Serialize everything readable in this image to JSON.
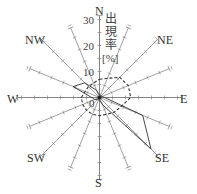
{
  "chart_data": {
    "type": "radar",
    "title": "",
    "axis_label": "出現率[%]",
    "axis_label_parts": [
      "出",
      "現",
      "率",
      "[%]"
    ],
    "radial_ticks": [
      0,
      10,
      20,
      30
    ],
    "radial_range": [
      0,
      30
    ],
    "directions": [
      "N",
      "NNE",
      "NE",
      "ENE",
      "E",
      "ESE",
      "SE",
      "SSE",
      "S",
      "SSW",
      "SW",
      "WSW",
      "W",
      "WNW",
      "NW",
      "NNW"
    ],
    "direction_labels": {
      "N": "N",
      "NE": "NE",
      "E": "E",
      "SE": "SE",
      "S": "S",
      "SW": "SW",
      "W": "W",
      "NW": "NW"
    },
    "series": [
      {
        "name": "solid",
        "style": "solid",
        "values": [
          1,
          1,
          1,
          1,
          2,
          18,
          28,
          3,
          1,
          1,
          1,
          2,
          3,
          11,
          8,
          3
        ]
      },
      {
        "name": "dashed",
        "style": "dashed",
        "values": [
          7,
          8,
          11,
          12,
          12,
          9,
          8,
          7,
          7,
          7,
          7,
          7,
          7,
          6,
          6,
          6
        ]
      }
    ]
  }
}
